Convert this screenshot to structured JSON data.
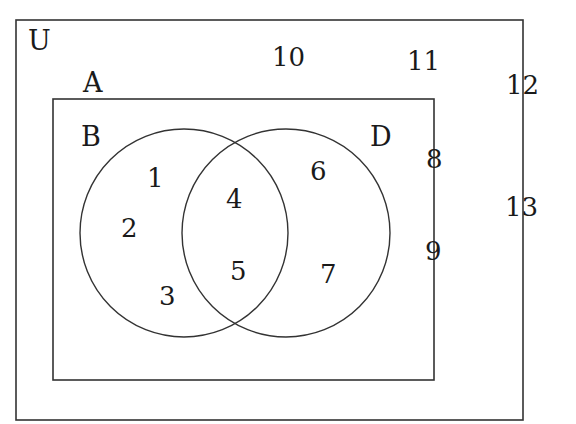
{
  "diagram": {
    "type": "venn",
    "universal_set": {
      "label": "U",
      "elements_outside_A": [
        "10",
        "11",
        "12",
        "13"
      ]
    },
    "set_A": {
      "label": "A",
      "elements_outside_circles": [
        "8",
        "9"
      ]
    },
    "set_B": {
      "label": "B",
      "only_elements": [
        "1",
        "2",
        "3"
      ]
    },
    "set_D": {
      "label": "D",
      "only_elements": [
        "6",
        "7"
      ]
    },
    "intersection_B_D": [
      "4",
      "5"
    ],
    "stroke_color": "#333333",
    "background": "#ffffff"
  },
  "labels": {
    "U": "U",
    "A": "A",
    "B": "B",
    "D": "D",
    "n1": "1",
    "n2": "2",
    "n3": "3",
    "n4": "4",
    "n5": "5",
    "n6": "6",
    "n7": "7",
    "n8": "8",
    "n9": "9",
    "n10": "10",
    "n11": "11",
    "n12": "12",
    "n13": "13"
  }
}
